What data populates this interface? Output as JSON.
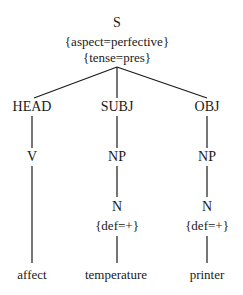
{
  "tree": {
    "root": {
      "label": "S",
      "features": [
        "{aspect=perfective}",
        "{tense=pres}"
      ]
    },
    "branches": [
      {
        "function": "HEAD",
        "category": "V",
        "leaf": "affect"
      },
      {
        "function": "SUBJ",
        "category": "NP",
        "subcategory": "N",
        "subfeature": "{def=+}",
        "leaf": "temperature"
      },
      {
        "function": "OBJ",
        "category": "NP",
        "subcategory": "N",
        "subfeature": "{def=+}",
        "leaf": "printer"
      }
    ]
  }
}
